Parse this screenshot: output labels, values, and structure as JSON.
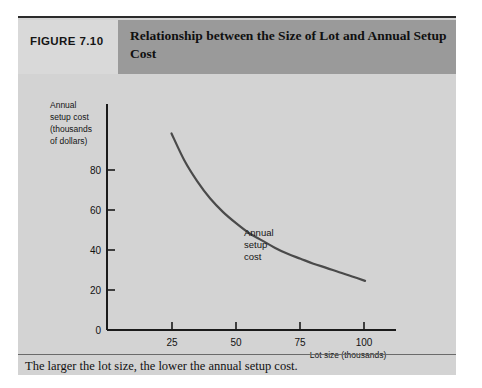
{
  "figure": {
    "number_label": "FIGURE 7.10",
    "title": "Relationship between the Size of Lot and Annual Setup Cost",
    "caption": "The larger the lot size, the lower the annual setup cost."
  },
  "colors": {
    "panel_background": "#d3d3d3",
    "number_cell_background": "#d9d9d9",
    "title_band_background": "#9a9a9a",
    "axis": "#1a1a1a",
    "curve": "#4a4a4a",
    "divider": "#6a6a6a"
  },
  "chart_data": {
    "type": "line",
    "title": "Relationship between the Size of Lot and Annual Setup Cost",
    "xlabel": "Lot size (thousands)",
    "ylabel": "Annual setup cost (thousands of dollars)",
    "ylabel_lines": [
      "Annual",
      "setup cost",
      "(thousands",
      "of dollars)"
    ],
    "annotation": "Annual setup cost",
    "annotation_lines": [
      "Annual",
      "setup",
      "cost"
    ],
    "grid": false,
    "legend": "none",
    "xlim": [
      0,
      112
    ],
    "ylim": [
      0,
      92
    ],
    "xticks": [
      25,
      50,
      75,
      100
    ],
    "xtick_labels": [
      "25",
      "50",
      "75",
      "100"
    ],
    "yticks": [
      0,
      20,
      40,
      60,
      80
    ],
    "ytick_labels": [
      "0",
      "20",
      "40",
      "60",
      "80"
    ],
    "series": [
      {
        "name": "Annual setup cost",
        "x": [
          25,
          30,
          35,
          40,
          45,
          50,
          55,
          60,
          65,
          70,
          75,
          80,
          85,
          90,
          95,
          100
        ],
        "y": [
          80,
          69,
          60.5,
          53.5,
          48,
          43.5,
          39.5,
          36.5,
          33.5,
          31,
          29,
          27,
          25.3,
          23.5,
          21.8,
          20
        ]
      }
    ]
  }
}
